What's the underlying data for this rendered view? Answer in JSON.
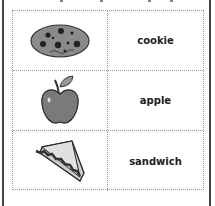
{
  "worksheet": {
    "rows": [
      {
        "icon": "cookie-icon",
        "word": "cookie"
      },
      {
        "icon": "apple-icon",
        "word": "apple"
      },
      {
        "icon": "sandwich-icon",
        "word": "sandwich"
      }
    ]
  }
}
